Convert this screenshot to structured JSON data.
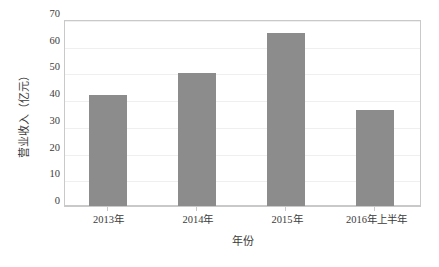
{
  "chart_data": {
    "type": "bar",
    "title": "",
    "subtitle": "",
    "xlabel": "年份",
    "ylabel": "营业收入（亿元）",
    "categories": [
      "2013年",
      "2014年",
      "2015年",
      "2016年上半年"
    ],
    "values": [
      42,
      50.5,
      65.5,
      36.5
    ],
    "series": [
      {
        "name": "营业收入",
        "values": [
          42,
          50.5,
          65.5,
          36.5
        ]
      }
    ],
    "ylim": [
      0,
      70
    ],
    "yticks": [
      0,
      10,
      20,
      30,
      40,
      50,
      60,
      70
    ],
    "ytick_labels": [
      "0",
      "10",
      "20",
      "30",
      "40",
      "50",
      "60",
      "70"
    ],
    "xlim_categories": 4,
    "grid": true,
    "grid_axis": "y",
    "legend": false,
    "legend_position": "none",
    "annotations": [],
    "colors": {
      "bar_fill": "#8c8c8c",
      "gridline": "#efefef",
      "axis_line": "#c9c9c9",
      "text": "#3b3b3b",
      "background": "#ffffff"
    }
  }
}
